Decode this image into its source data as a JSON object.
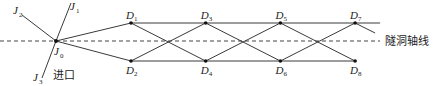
{
  "diagram": {
    "axis_label": "隧洞轴线",
    "entrance_label": "进口",
    "origin": {
      "name": "J",
      "sub": "0"
    },
    "rays": [
      {
        "name": "J",
        "sub": "1"
      },
      {
        "name": "J",
        "sub": "2"
      },
      {
        "name": "J",
        "sub": "3"
      }
    ],
    "points": [
      {
        "name": "D",
        "sub": "1",
        "side": "top"
      },
      {
        "name": "D",
        "sub": "2",
        "side": "bottom"
      },
      {
        "name": "D",
        "sub": "3",
        "side": "top"
      },
      {
        "name": "D",
        "sub": "4",
        "side": "bottom"
      },
      {
        "name": "D",
        "sub": "5",
        "side": "top"
      },
      {
        "name": "D",
        "sub": "6",
        "side": "bottom"
      },
      {
        "name": "D",
        "sub": "7",
        "side": "top"
      },
      {
        "name": "D",
        "sub": "8",
        "side": "bottom"
      }
    ]
  }
}
